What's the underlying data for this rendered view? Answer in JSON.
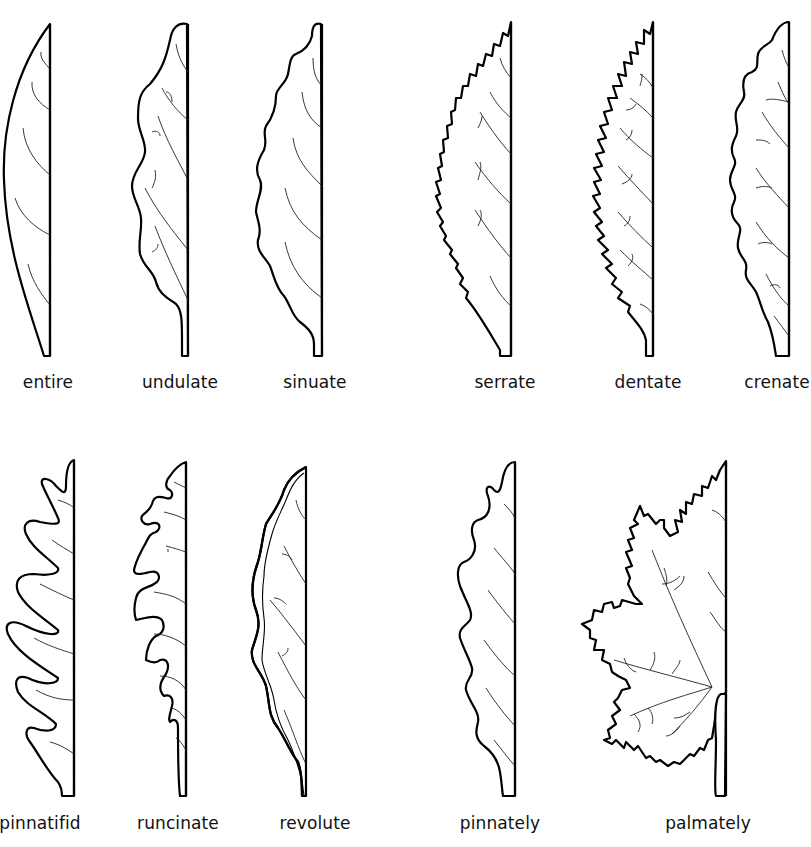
{
  "diagram": {
    "colors": {
      "stroke": "#000000",
      "vein": "#222222",
      "background": "#ffffff",
      "label": "#111111"
    },
    "rows": [
      {
        "items": [
          {
            "id": "entire",
            "label": "entire",
            "label_x": 48,
            "label_y": 382
          },
          {
            "id": "undulate",
            "label": "undulate",
            "label_x": 180,
            "label_y": 382
          },
          {
            "id": "sinuate",
            "label": "sinuate",
            "label_x": 315,
            "label_y": 382
          },
          {
            "id": "serrate",
            "label": "serrate",
            "label_x": 505,
            "label_y": 382
          },
          {
            "id": "dentate",
            "label": "dentate",
            "label_x": 648,
            "label_y": 382
          },
          {
            "id": "crenate",
            "label": "crenate",
            "label_x": 777,
            "label_y": 382
          }
        ]
      },
      {
        "items": [
          {
            "id": "pinnatifid",
            "label": "pinnatifid",
            "label_x": 40,
            "label_y": 823
          },
          {
            "id": "runcinate",
            "label": "runcinate",
            "label_x": 178,
            "label_y": 823
          },
          {
            "id": "revolute",
            "label": "revolute",
            "label_x": 315,
            "label_y": 823
          },
          {
            "id": "pinnately",
            "label": "pinnately",
            "label_x": 500,
            "label_y": 823
          },
          {
            "id": "palmately",
            "label": "palmately",
            "label_x": 708,
            "label_y": 823
          }
        ]
      }
    ],
    "labels": {
      "entire": "entire",
      "undulate": "undulate",
      "sinuate": "sinuate",
      "serrate": "serrate",
      "dentate": "dentate",
      "crenate": "crenate",
      "pinnatifid": "pinnatifid",
      "runcinate": "runcinate",
      "revolute": "revolute",
      "pinnately": "pinnately",
      "palmately": "palmately"
    }
  }
}
